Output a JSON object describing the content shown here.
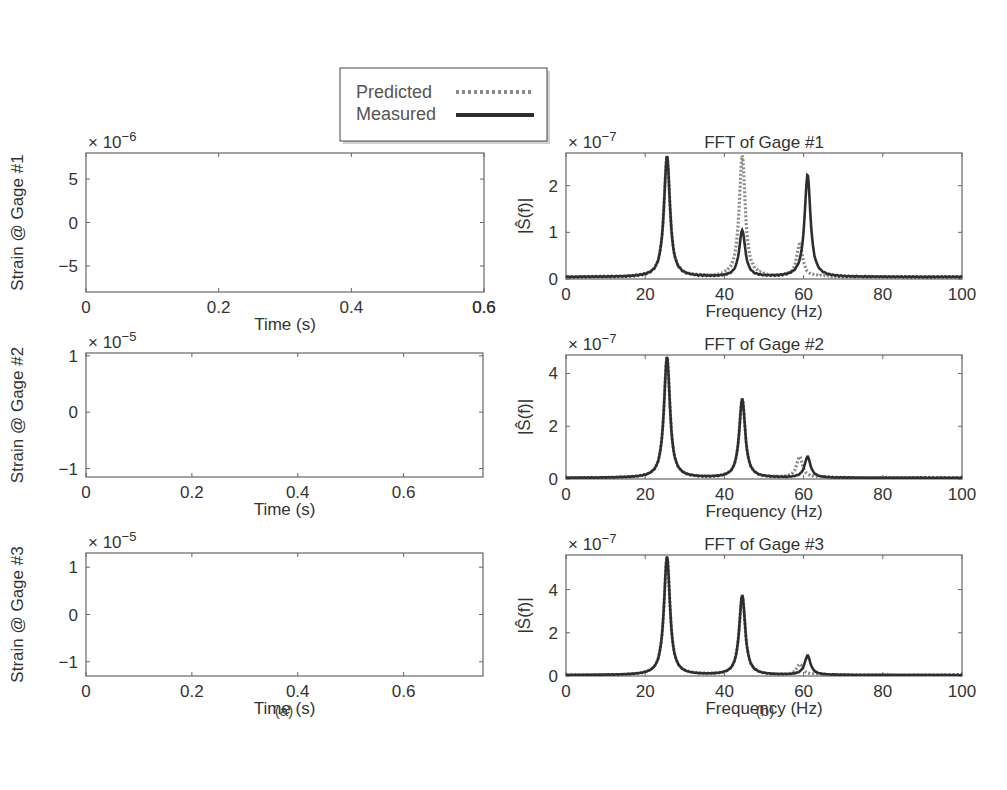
{
  "legend": {
    "entries": [
      {
        "label": "Predicted",
        "style": "dotted",
        "color": "#8a8a8a"
      },
      {
        "label": "Measured",
        "style": "solid",
        "color": "#2e2e2e"
      }
    ]
  },
  "captions": {
    "left": "(a)",
    "right": "(b)"
  },
  "chart_data": [
    {
      "type": "line",
      "panel": "a1",
      "title": "",
      "ylabel": "Strain @ Gage #1",
      "xlabel": "Time (s)",
      "y_exponent": "× 10^-6",
      "y_exponent_base": "× 10",
      "y_exponent_power": "−6",
      "xlim": [
        0,
        0.6
      ],
      "ylim": [
        -8,
        8
      ],
      "xticks": [
        "0",
        "0.2",
        "0.4",
        "0.6",
        "0.6"
      ],
      "yticks": [
        "5",
        "0",
        "−5"
      ],
      "series": [
        {
          "name": "Predicted",
          "description": "oscillating strain signal, amplitude ~±7e-6"
        },
        {
          "name": "Measured",
          "description": "oscillating strain signal closely tracking Predicted, amplitude ~±7e-6"
        }
      ]
    },
    {
      "type": "line",
      "panel": "a2",
      "ylabel": "Strain @ Gage #2",
      "xlabel": "Time (s)",
      "y_exponent_base": "× 10",
      "y_exponent_power": "−5",
      "xlim": [
        0,
        0.75
      ],
      "ylim": [
        -1.15,
        1.05
      ],
      "xticks": [
        "0",
        "0.2",
        "0.4",
        "0.6"
      ],
      "yticks": [
        "1",
        "0",
        "−1"
      ],
      "series": [
        {
          "name": "Predicted",
          "description": "oscillating strain, amplitude ~±1e-5"
        },
        {
          "name": "Measured",
          "description": "oscillating strain closely tracking Predicted"
        }
      ]
    },
    {
      "type": "line",
      "panel": "a3",
      "ylabel": "Strain @ Gage #3",
      "xlabel": "Time (s)",
      "y_exponent_base": "× 10",
      "y_exponent_power": "−5",
      "xlim": [
        0,
        0.75
      ],
      "ylim": [
        -1.3,
        1.3
      ],
      "xticks": [
        "0",
        "0.2",
        "0.4",
        "0.6"
      ],
      "yticks": [
        "1",
        "0",
        "−1"
      ],
      "series": [
        {
          "name": "Predicted",
          "description": "oscillating strain, amplitude ~±1.2e-5"
        },
        {
          "name": "Measured",
          "description": "oscillating strain closely tracking Predicted"
        }
      ]
    },
    {
      "type": "line",
      "panel": "b1",
      "title": "FFT of Gage #1",
      "ylabel": "|Ŝ(f)|",
      "xlabel": "Frequency (Hz)",
      "y_exponent_base": "× 10",
      "y_exponent_power": "−7",
      "xlim": [
        0,
        100
      ],
      "ylim": [
        0,
        2.7
      ],
      "xticks": [
        "0",
        "20",
        "40",
        "60",
        "80",
        "100"
      ],
      "yticks": [
        "0",
        "1",
        "2"
      ],
      "series": [
        {
          "name": "Predicted",
          "peaks": [
            {
              "f": 25.5,
              "amp": 2.6
            },
            {
              "f": 44.5,
              "amp": 2.6
            },
            {
              "f": 59,
              "amp": 0.7
            }
          ]
        },
        {
          "name": "Measured",
          "peaks": [
            {
              "f": 25.5,
              "amp": 2.6
            },
            {
              "f": 44.5,
              "amp": 1.0
            },
            {
              "f": 61,
              "amp": 2.2
            }
          ]
        }
      ]
    },
    {
      "type": "line",
      "panel": "b2",
      "title": "FFT of Gage #2",
      "ylabel": "|Ŝ(f)|",
      "xlabel": "Frequency (Hz)",
      "y_exponent_base": "× 10",
      "y_exponent_power": "−7",
      "xlim": [
        0,
        100
      ],
      "ylim": [
        0,
        4.7
      ],
      "xticks": [
        "0",
        "20",
        "40",
        "60",
        "80",
        "100"
      ],
      "yticks": [
        "0",
        "2",
        "4"
      ],
      "series": [
        {
          "name": "Predicted",
          "peaks": [
            {
              "f": 25.5,
              "amp": 4.6
            },
            {
              "f": 44.5,
              "amp": 3.0
            },
            {
              "f": 59,
              "amp": 0.8
            }
          ]
        },
        {
          "name": "Measured",
          "peaks": [
            {
              "f": 25.5,
              "amp": 4.6
            },
            {
              "f": 44.5,
              "amp": 3.0
            },
            {
              "f": 61,
              "amp": 0.8
            }
          ]
        }
      ]
    },
    {
      "type": "line",
      "panel": "b3",
      "title": "FFT of Gage #3",
      "ylabel": "|Ŝ(f)|",
      "xlabel": "Frequency (Hz)",
      "y_exponent_base": "× 10",
      "y_exponent_power": "−7",
      "xlim": [
        0,
        100
      ],
      "ylim": [
        0,
        5.6
      ],
      "xticks": [
        "0",
        "20",
        "40",
        "60",
        "80",
        "100"
      ],
      "yticks": [
        "0",
        "2",
        "4"
      ],
      "series": [
        {
          "name": "Predicted",
          "peaks": [
            {
              "f": 25.5,
              "amp": 5.5
            },
            {
              "f": 44.5,
              "amp": 3.7
            },
            {
              "f": 59,
              "amp": 0.5
            }
          ]
        },
        {
          "name": "Measured",
          "peaks": [
            {
              "f": 25.5,
              "amp": 5.5
            },
            {
              "f": 44.5,
              "amp": 3.7
            },
            {
              "f": 61,
              "amp": 0.9
            }
          ]
        }
      ]
    }
  ]
}
